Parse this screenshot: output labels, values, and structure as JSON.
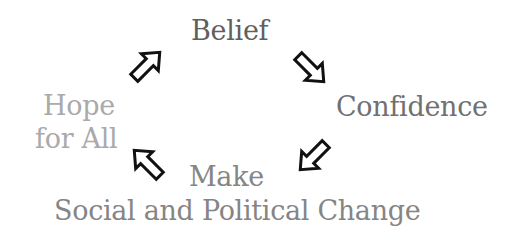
{
  "diagram": {
    "type": "cycle",
    "nodes": [
      {
        "id": "belief",
        "label": "Belief",
        "color": "#5f5f5f"
      },
      {
        "id": "confidence",
        "label": "Confidence",
        "color": "#707070"
      },
      {
        "id": "make_change_line1",
        "label": "Make",
        "color": "#858585"
      },
      {
        "id": "make_change_line2",
        "label": "Social and Political Change",
        "color": "#858585"
      },
      {
        "id": "hope_line1",
        "label": "Hope",
        "color": "#aaaaaa"
      },
      {
        "id": "hope_line2",
        "label": "for All",
        "color": "#aaaaaa"
      }
    ],
    "edges": [
      {
        "from": "Belief",
        "to": "Confidence",
        "arrow": "down-right-outline-arrow"
      },
      {
        "from": "Confidence",
        "to": "Make Social and Political Change",
        "arrow": "down-left-outline-arrow"
      },
      {
        "from": "Make Social and Political Change",
        "to": "Hope for All",
        "arrow": "up-left-outline-arrow"
      },
      {
        "from": "Hope for All",
        "to": "Belief",
        "arrow": "up-right-outline-arrow"
      }
    ],
    "arrow_color": "#111111"
  }
}
